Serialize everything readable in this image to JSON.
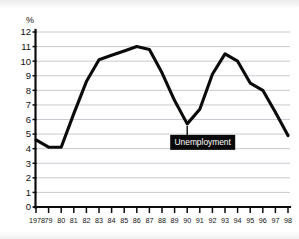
{
  "chart_data": {
    "type": "line",
    "title": "",
    "subtitle": "",
    "xlabel": "",
    "ylabel": "%",
    "ylim": [
      0,
      12
    ],
    "xlim": [
      1978,
      1998
    ],
    "grid": true,
    "legend_position": "none",
    "y_ticks": [
      "0",
      "1",
      "2",
      "3",
      "4",
      "5",
      "6",
      "7",
      "8",
      "9",
      "10",
      "11",
      "12"
    ],
    "y_tick_values": [
      0,
      1,
      2,
      3,
      4,
      5,
      6,
      7,
      8,
      9,
      10,
      11,
      12
    ],
    "x_tick_labels": [
      "1978",
      "79",
      "80",
      "81",
      "82",
      "83",
      "84",
      "85",
      "86",
      "87",
      "88",
      "89",
      "90",
      "91",
      "92",
      "93",
      "94",
      "95",
      "96",
      "97",
      "98"
    ],
    "x": [
      1978,
      1979,
      1980,
      1981,
      1982,
      1983,
      1984,
      1985,
      1986,
      1987,
      1988,
      1989,
      1990,
      1991,
      1992,
      1993,
      1994,
      1995,
      1996,
      1997,
      1998
    ],
    "series": [
      {
        "name": "Unemployment",
        "values": [
          4.6,
          4.1,
          4.1,
          6.4,
          8.6,
          10.1,
          10.4,
          10.7,
          11.0,
          10.8,
          9.2,
          7.3,
          5.7,
          6.7,
          9.1,
          10.5,
          10.0,
          8.5,
          8.0,
          6.5,
          4.9
        ]
      }
    ],
    "annotations": [
      {
        "text": "Unemployment",
        "style": "black-box-white-text",
        "points_to_year": 1990,
        "points_to_value": 5.7
      }
    ],
    "colors": {
      "line": "#0b0b0b",
      "grid": "#b9bdc4",
      "axis": "#0d0d0d",
      "callout_bg": "#0a0a0a",
      "callout_fg": "#ffffff",
      "background": "#ffffff"
    }
  }
}
